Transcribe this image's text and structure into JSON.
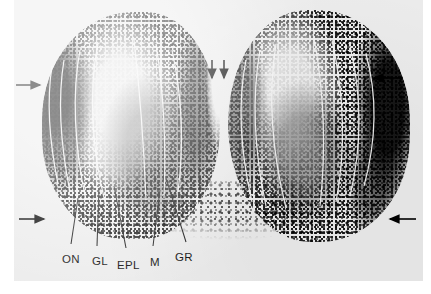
{
  "figure": {
    "kind": "autoradiograph-photomicrograph",
    "plate_background_color": "#ececec",
    "page_background_color": "#ffffff",
    "ink_color": "#000000",
    "delineation_line_color": "#f4f4f4"
  },
  "labels": [
    {
      "id": "ON",
      "text": "ON",
      "meaning": "olfactory nerve layer",
      "x": 62,
      "y": 260
    },
    {
      "id": "GL",
      "text": "GL",
      "meaning": "glomerular layer",
      "x": 92,
      "y": 262
    },
    {
      "id": "EPL",
      "text": "EPL",
      "meaning": "external plexiform layer",
      "x": 117,
      "y": 266
    },
    {
      "id": "M",
      "text": "M",
      "meaning": "mitral cell layer",
      "x": 150,
      "y": 263
    },
    {
      "id": "GR",
      "text": "GR",
      "meaning": "granule cell layer",
      "x": 175,
      "y": 258
    }
  ],
  "leader_lines": [
    {
      "for": "ON",
      "path": "M 64 198 L 57 244"
    },
    {
      "for": "GL",
      "path": "M 85 188 L 83 246"
    },
    {
      "for": "EPL",
      "path": "M 100 186 L 112 248"
    },
    {
      "for": "M",
      "path": "M 146 190 L 139 246"
    },
    {
      "for": "GR",
      "path": "M 152 178 L 172 242"
    }
  ],
  "arrows": [
    {
      "id": "arrow-left-upper",
      "direction": "right",
      "tail_x": 2,
      "tail_y": 85,
      "tip_x": 28,
      "tip_y": 85
    },
    {
      "id": "arrow-left-lower",
      "direction": "right",
      "tail_x": 5,
      "tail_y": 219,
      "tip_x": 32,
      "tip_y": 219
    },
    {
      "id": "arrow-right-upper",
      "direction": "left",
      "tail_x": 388,
      "tail_y": 78,
      "tip_x": 358,
      "tip_y": 78
    },
    {
      "id": "arrow-right-lower",
      "direction": "left",
      "tail_x": 402,
      "tail_y": 219,
      "tip_x": 374,
      "tip_y": 219
    },
    {
      "id": "arrow-midline-left",
      "direction": "down",
      "tail_x": 198,
      "tail_y": 60,
      "tip_x": 198,
      "tip_y": 80
    },
    {
      "id": "arrow-midline-right",
      "direction": "down",
      "tail_x": 210,
      "tail_y": 60,
      "tip_x": 210,
      "tip_y": 80
    }
  ],
  "structures": {
    "left_bulb": "left olfactory bulb",
    "right_bulb": "right olfactory bulb",
    "midline_fissure": "interbulbar midline fissure"
  }
}
